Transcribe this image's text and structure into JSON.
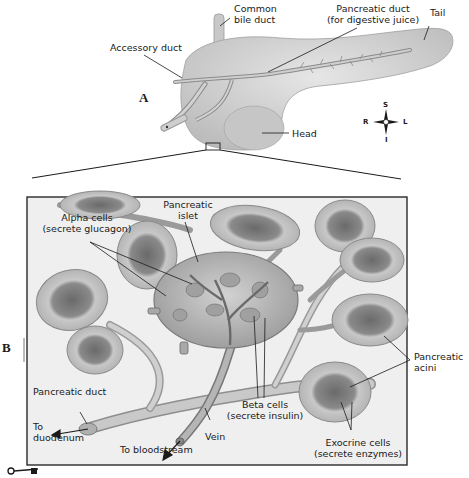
{
  "diagram": {
    "colors": {
      "tissue_light": "#dcdcdc",
      "tissue_mid": "#b8b8b8",
      "tissue_dark": "#7a7a7a",
      "line": "#1a1a1a",
      "frame": "#2a2a2a"
    },
    "panel_a": {
      "letter": "A",
      "labels": {
        "common_bile_duct_1": "Common",
        "common_bile_duct_2": "bile duct",
        "pancreatic_duct_1": "Pancreatic duct",
        "pancreatic_duct_2": "(for digestive juice)",
        "tail": "Tail",
        "accessory_duct": "Accessory duct",
        "head": "Head"
      },
      "compass": {
        "superior": "S",
        "inferior": "I",
        "right": "R",
        "left": "L"
      }
    },
    "panel_b": {
      "letter": "B",
      "labels": {
        "alpha_cells_1": "Alpha cells",
        "alpha_cells_2": "(secrete glucagon)",
        "pancreatic_islet_1": "Pancreatic",
        "pancreatic_islet_2": "islet",
        "pancreatic_duct": "Pancreatic duct",
        "to_duodenum_1": "To",
        "to_duodenum_2": "duodenum",
        "to_bloodstream": "To bloodstream",
        "vein": "Vein",
        "beta_cells_1": "Beta cells",
        "beta_cells_2": "(secrete insulin)",
        "pancreatic_acini_1": "Pancreatic",
        "pancreatic_acini_2": "acini",
        "exocrine_cells_1": "Exocrine cells",
        "exocrine_cells_2": "(secrete enzymes)"
      }
    }
  }
}
